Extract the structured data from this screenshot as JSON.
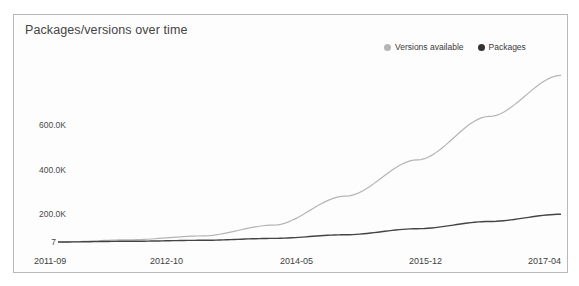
{
  "chart": {
    "title": "Packages/versions over time",
    "legend": [
      {
        "label": "Versions available",
        "color": "#b5b5b5",
        "marker": "legend-dot-versions"
      },
      {
        "label": "Packages",
        "color": "#333333",
        "marker": "legend-dot-packages"
      }
    ]
  },
  "chart_data": {
    "type": "line",
    "title": "Packages/versions over time",
    "xlabel": "",
    "ylabel": "",
    "grid": false,
    "legend_position": "top-right",
    "categories": [
      "2011-09",
      "2012-10",
      "2014-05",
      "2015-12",
      "2017-04"
    ],
    "x_tick_labels": [
      "2011-09",
      "2012-10",
      "2014-05",
      "2015-12",
      "2017-04"
    ],
    "y_tick_labels": [
      "7",
      "200.0K",
      "400.0K",
      "600.0K"
    ],
    "y_tick_values": [
      7,
      200000,
      400000,
      600000
    ],
    "ylim": [
      7,
      700000
    ],
    "series": [
      {
        "name": "Versions available",
        "color": "#b5b5b5",
        "x": [
          "2011-09",
          "2012-10",
          "2013-04",
          "2014-05",
          "2015-02",
          "2015-12",
          "2016-08",
          "2017-04"
        ],
        "values": [
          7,
          9000,
          25000,
          70000,
          190000,
          340000,
          520000,
          690000
        ]
      },
      {
        "name": "Packages",
        "color": "#444444",
        "x": [
          "2011-09",
          "2012-10",
          "2013-04",
          "2014-05",
          "2015-02",
          "2015-12",
          "2016-08",
          "2017-04"
        ],
        "values": [
          7,
          3000,
          7000,
          15000,
          30000,
          55000,
          85000,
          115000
        ]
      }
    ]
  },
  "axis": {
    "y_ticks": [
      {
        "label": "600.0K",
        "top": 105,
        "right": 52
      },
      {
        "label": "400.0K",
        "top": 150,
        "right": 52
      },
      {
        "label": "200.0K",
        "top": 194,
        "right": 52
      },
      {
        "label": "7",
        "top": 236,
        "right": 52
      }
    ],
    "x_ticks": [
      {
        "label": "2011-09",
        "left": 20
      },
      {
        "label": "2012-10",
        "left": 136
      },
      {
        "label": "2014-05",
        "left": 266
      },
      {
        "label": "2015-12",
        "left": 395
      },
      {
        "label": "2017-04",
        "left": 514
      }
    ]
  }
}
